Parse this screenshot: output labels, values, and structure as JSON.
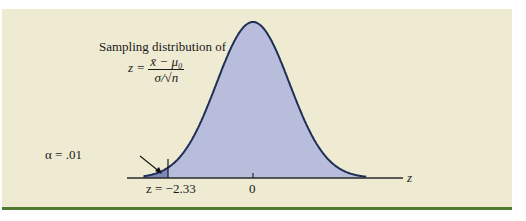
{
  "figure": {
    "title": "Sampling distribution of",
    "formula": {
      "lhs": "z =",
      "numerator": "x̄ − μ₀",
      "denominator": "σ/√n"
    },
    "alpha_label": "α = .01",
    "critical_label": "z = −2.33",
    "center_label": "0",
    "axis_label": "z"
  },
  "colors": {
    "background": "#efead2",
    "frame_bar": "#4f7a32",
    "curve_fill": "#b8bddb",
    "tail_fill": "#7e88b8",
    "curve_line": "#1f2f55",
    "axis": "#2a2a2a"
  },
  "chart_data": {
    "type": "area",
    "xlabel": "z",
    "ylabel": "",
    "distribution": "standard normal",
    "mean": 0,
    "sd": 1,
    "x_ticks": [
      -2.33,
      0
    ],
    "x_tick_labels": [
      "z = −2.33",
      "0"
    ],
    "shaded_region": {
      "from": "-inf",
      "to": -2.33,
      "area": 0.01,
      "label": "α = .01"
    },
    "critical_value": -2.33,
    "test": "lower-tail",
    "xlim": [
      -3.0,
      3.1
    ],
    "grid": false
  }
}
